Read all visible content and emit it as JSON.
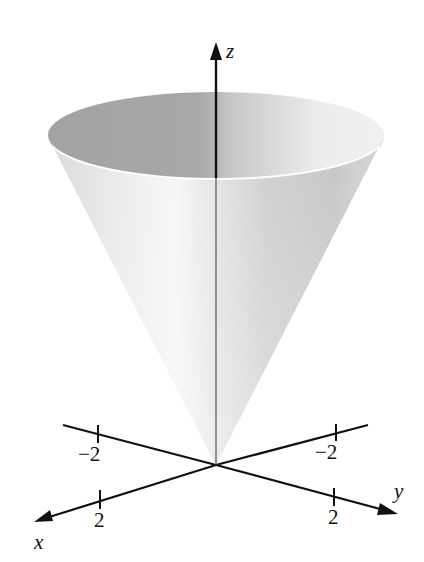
{
  "figure": {
    "surface_color_dark": "#9a9a9a",
    "surface_color_light": "#f2f2f2",
    "axis_color": "#111111"
  },
  "axes": {
    "x": {
      "label": "x",
      "ticks": [
        {
          "value": -2,
          "label": "−2"
        },
        {
          "value": 2,
          "label": "2"
        }
      ]
    },
    "y": {
      "label": "y",
      "ticks": [
        {
          "value": -2,
          "label": "−2"
        },
        {
          "value": 2,
          "label": "2"
        }
      ]
    },
    "z": {
      "label": "z",
      "ticks": []
    }
  }
}
